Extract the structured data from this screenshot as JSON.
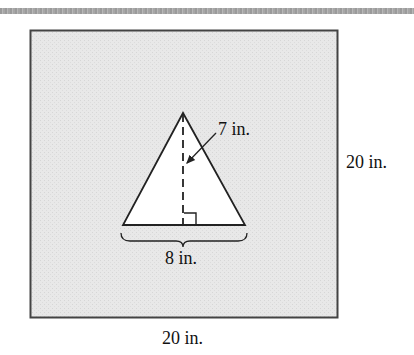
{
  "figure": {
    "type": "geometry-diagram",
    "square": {
      "width_label": "20 in.",
      "height_label": "20 in.",
      "fill": "#e9e9e9",
      "border": "#444444"
    },
    "triangle": {
      "base_label": "8 in.",
      "height_label": "7 in.",
      "fill": "#ffffff",
      "stroke": "#222222"
    },
    "annotations": [
      "right-angle-mark",
      "dashed-height-line",
      "base-brace",
      "leader-arrow"
    ]
  },
  "labels": {
    "triangle_height": "7 in.",
    "triangle_base": "8 in.",
    "square_side_right": "20 in.",
    "square_side_bottom": "20 in."
  }
}
